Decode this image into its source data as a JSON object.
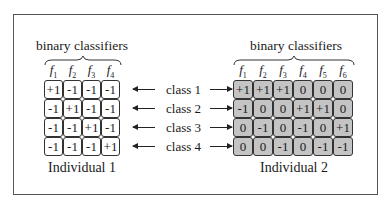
{
  "left": {
    "header": "binary classifiers",
    "classifiers": [
      "1",
      "2",
      "3",
      "4"
    ],
    "matrix": [
      [
        "+1",
        "-1",
        "-1",
        "-1"
      ],
      [
        "-1",
        "+1",
        "-1",
        "-1"
      ],
      [
        "-1",
        "-1",
        "+1",
        "-1"
      ],
      [
        "-1",
        "-1",
        "-1",
        "+1"
      ]
    ],
    "caption": "Individual 1"
  },
  "right": {
    "header": "binary classifiers",
    "classifiers": [
      "1",
      "2",
      "3",
      "4",
      "5",
      "6"
    ],
    "matrix": [
      [
        "+1",
        "+1",
        "+1",
        "0",
        "0",
        "0"
      ],
      [
        "-1",
        "0",
        "0",
        "+1",
        "+1",
        "0"
      ],
      [
        "0",
        "-1",
        "0",
        "-1",
        "0",
        "+1"
      ],
      [
        "0",
        "0",
        "-1",
        "0",
        "-1",
        "-1"
      ]
    ],
    "caption": "Individual 2"
  },
  "classes": [
    "class 1",
    "class 2",
    "class 3",
    "class 4"
  ],
  "colors": {
    "left_cell": "#ffffff",
    "right_cell": "#c4c4c4",
    "border": "#333333"
  }
}
